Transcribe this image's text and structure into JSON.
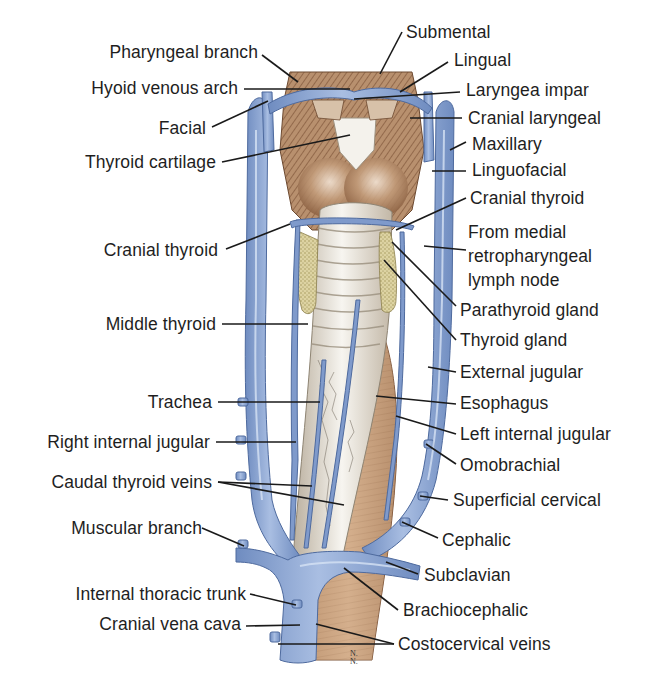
{
  "figure": {
    "colors": {
      "vein": "#8aa6d2",
      "vein_dark": "#5c78ab",
      "vein_highlight": "#c5d5ee",
      "muscle": "#b8906e",
      "muscle_dark": "#7d5438",
      "trachea": "#eae6de",
      "trachea_ring": "#a69c8d",
      "thyroid": "#d9cf9c",
      "esophagus": "#c9a27e",
      "cartilage": "#f3f1ec",
      "leader_line": "#1a1a1a",
      "text": "#1e1e1e"
    },
    "signature": "N.\nN."
  },
  "labels": {
    "left": [
      {
        "id": "pharyngeal-branch",
        "text": "Pharyngeal branch",
        "right_edge": 258,
        "y": 42,
        "line": [
          262,
          55,
          298,
          82
        ]
      },
      {
        "id": "hyoid-venous-arch",
        "text": "Hyoid venous arch",
        "right_edge": 238,
        "y": 78,
        "line": [
          244,
          89,
          350,
          89
        ]
      },
      {
        "id": "facial",
        "text": "Facial",
        "right_edge": 206,
        "y": 118,
        "line": [
          212,
          127,
          268,
          101
        ]
      },
      {
        "id": "thyroid-cartilage",
        "text": "Thyroid cartilage",
        "right_edge": 216,
        "y": 152,
        "line": [
          222,
          162,
          350,
          135
        ]
      },
      {
        "id": "cranial-thyroid-left",
        "text": "Cranial thyroid",
        "right_edge": 218,
        "y": 240,
        "line": [
          226,
          249,
          290,
          224
        ]
      },
      {
        "id": "middle-thyroid",
        "text": "Middle thyroid",
        "right_edge": 216,
        "y": 314,
        "line": [
          222,
          324,
          308,
          324
        ]
      },
      {
        "id": "trachea",
        "text": "Trachea",
        "right_edge": 212,
        "y": 392,
        "line": [
          218,
          402,
          320,
          402
        ]
      },
      {
        "id": "right-internal-jugular",
        "text": "Right internal jugular",
        "right_edge": 210,
        "y": 432,
        "line": [
          216,
          442,
          296,
          442
        ]
      },
      {
        "id": "caudal-thyroid-veins",
        "text": "Caudal thyroid veins",
        "right_edge": 212,
        "y": 472,
        "line": [
          218,
          482,
          312,
          486
        ],
        "line2": [
          218,
          482,
          344,
          505
        ]
      },
      {
        "id": "muscular-branch",
        "text": "Muscular branch",
        "right_edge": 202,
        "y": 518,
        "line": [
          202,
          528,
          244,
          546
        ]
      },
      {
        "id": "internal-thoracic-trunk",
        "text": "Internal thoracic trunk",
        "right_edge": 246,
        "y": 584,
        "line": [
          250,
          594,
          296,
          605
        ]
      },
      {
        "id": "cranial-vena-cava",
        "text": "Cranial vena cava",
        "right_edge": 241,
        "y": 614,
        "line": [
          246,
          626,
          300,
          625
        ]
      }
    ],
    "right": [
      {
        "id": "submental",
        "text": "Submental",
        "left": 406,
        "y": 22,
        "line": [
          402,
          32,
          380,
          74
        ]
      },
      {
        "id": "lingual",
        "text": "Lingual",
        "left": 454,
        "y": 50,
        "line": [
          448,
          62,
          400,
          92
        ]
      },
      {
        "id": "laryngea-impar",
        "text": "Laryngea impar",
        "left": 466,
        "y": 80,
        "line": [
          460,
          92,
          354,
          99
        ]
      },
      {
        "id": "cranial-laryngeal",
        "text": "Cranial laryngeal",
        "left": 468,
        "y": 108,
        "line": [
          462,
          118,
          410,
          118
        ]
      },
      {
        "id": "maxillary",
        "text": "Maxillary",
        "left": 472,
        "y": 134,
        "line": [
          466,
          142,
          450,
          150
        ]
      },
      {
        "id": "linguofacial",
        "text": "Linguofacial",
        "left": 472,
        "y": 160,
        "line": [
          466,
          171,
          432,
          171
        ]
      },
      {
        "id": "cranial-thyroid-right",
        "text": "Cranial thyroid",
        "left": 470,
        "y": 188,
        "line": [
          466,
          198,
          396,
          230
        ]
      },
      {
        "id": "retropharyngeal",
        "text": "From medial\nretropharyngeal\nlymph node",
        "left": 468,
        "y": 220,
        "line": [
          466,
          250,
          424,
          246
        ]
      },
      {
        "id": "parathyroid-gland",
        "text": "Parathyroid gland",
        "left": 460,
        "y": 300,
        "line": [
          456,
          306,
          392,
          242
        ]
      },
      {
        "id": "thyroid-gland",
        "text": "Thyroid gland",
        "left": 460,
        "y": 330,
        "line": [
          456,
          340,
          384,
          260
        ]
      },
      {
        "id": "external-jugular",
        "text": "External jugular",
        "left": 460,
        "y": 362,
        "line": [
          456,
          372,
          428,
          367
        ]
      },
      {
        "id": "esophagus",
        "text": "Esophagus",
        "left": 460,
        "y": 393,
        "line": [
          456,
          404,
          376,
          396
        ]
      },
      {
        "id": "left-internal-jugular",
        "text": "Left internal jugular",
        "left": 460,
        "y": 424,
        "line": [
          456,
          434,
          396,
          416
        ]
      },
      {
        "id": "omobrachial",
        "text": "Omobrachial",
        "left": 460,
        "y": 455,
        "line": [
          456,
          464,
          426,
          444
        ]
      },
      {
        "id": "superficial-cervical",
        "text": "Superficial cervical",
        "left": 453,
        "y": 490,
        "line": [
          448,
          500,
          420,
          496
        ]
      },
      {
        "id": "cephalic",
        "text": "Cephalic",
        "left": 442,
        "y": 530,
        "line": [
          438,
          538,
          402,
          522
        ]
      },
      {
        "id": "subclavian",
        "text": "Subclavian",
        "left": 424,
        "y": 565,
        "line": [
          418,
          574,
          386,
          562
        ]
      },
      {
        "id": "brachiocephalic",
        "text": "Brachiocephalic",
        "left": 403,
        "y": 600,
        "line": [
          398,
          610,
          344,
          568
        ]
      },
      {
        "id": "costocervical-veins",
        "text": "Costocervical veins",
        "left": 398,
        "y": 634,
        "line": [
          394,
          644,
          316,
          624
        ],
        "line2": [
          394,
          644,
          278,
          644
        ]
      }
    ]
  }
}
